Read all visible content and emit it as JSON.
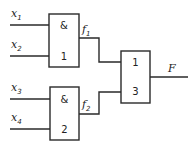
{
  "diagram": {
    "type": "logic-circuit",
    "inputs": [
      {
        "name": "x",
        "sub": "1"
      },
      {
        "name": "x",
        "sub": "2"
      },
      {
        "name": "x",
        "sub": "3"
      },
      {
        "name": "x",
        "sub": "4"
      }
    ],
    "gates": [
      {
        "id": "1",
        "op": "&",
        "number": "1",
        "inputs": [
          "x1",
          "x2"
        ],
        "output": "f1"
      },
      {
        "id": "2",
        "op": "&",
        "number": "2",
        "inputs": [
          "x3",
          "x4"
        ],
        "output": "f2"
      },
      {
        "id": "3",
        "op": "1",
        "number": "3",
        "inputs": [
          "f1",
          "f2"
        ],
        "output": "F"
      }
    ],
    "intermediate": [
      {
        "name": "f",
        "sub": "1"
      },
      {
        "name": "f",
        "sub": "2"
      }
    ],
    "output": {
      "name": "F"
    }
  }
}
